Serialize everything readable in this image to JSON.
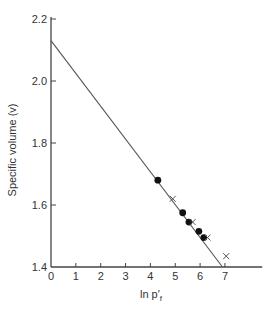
{
  "chart_data": {
    "type": "scatter",
    "title": "",
    "xlabel": "ln p′f",
    "xlabel_main": "ln p′",
    "xlabel_sub": "f",
    "ylabel": "Specific volume (v)",
    "xlim": [
      0,
      8.5
    ],
    "ylim": [
      1.4,
      2.2
    ],
    "x_ticks": [
      0,
      1,
      2,
      3,
      4,
      5,
      6,
      7
    ],
    "x_tick_labels": [
      "0",
      "1",
      "2",
      "3",
      "4",
      "5",
      "6",
      "7"
    ],
    "y_ticks": [
      1.4,
      1.6,
      1.8,
      2.0,
      2.2
    ],
    "y_tick_labels": [
      "1.4",
      "1.6",
      "1.8",
      "2.0",
      "2.2"
    ],
    "grid": false,
    "legend": null,
    "series": [
      {
        "name": "filled-circles",
        "marker": "circle",
        "points": [
          {
            "x": 4.3,
            "y": 1.68
          },
          {
            "x": 5.3,
            "y": 1.575
          },
          {
            "x": 5.55,
            "y": 1.545
          },
          {
            "x": 5.95,
            "y": 1.515
          },
          {
            "x": 6.15,
            "y": 1.495
          }
        ]
      },
      {
        "name": "crosses",
        "marker": "x",
        "points": [
          {
            "x": 4.9,
            "y": 1.62
          },
          {
            "x": 5.7,
            "y": 1.545
          },
          {
            "x": 6.3,
            "y": 1.495
          },
          {
            "x": 7.05,
            "y": 1.435
          }
        ]
      }
    ],
    "lines": [
      {
        "name": "fitted-line",
        "from": {
          "x": 0,
          "y": 2.13
        },
        "to": {
          "x": 6.9,
          "y": 1.4
        }
      }
    ]
  },
  "colors": {
    "axis": "#444444",
    "line": "#555555",
    "marker": "#111111",
    "text": "#333333"
  }
}
